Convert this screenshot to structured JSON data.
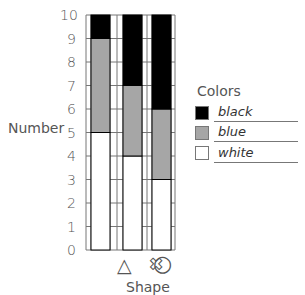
{
  "chart_data": {
    "type": "bar",
    "stacked": true,
    "title": "",
    "xlabel": "Shape",
    "ylabel": "Number",
    "ylim": [
      0,
      10
    ],
    "yticks": [
      "0",
      "1",
      "2",
      "3",
      "4",
      "5",
      "6",
      "7",
      "8",
      "9",
      "10"
    ],
    "categories": [
      "triangle",
      "cross",
      "circle"
    ],
    "category_symbols": [
      "△",
      "✖",
      "○"
    ],
    "series": [
      {
        "name": "white",
        "color": "#ffffff",
        "values": [
          5,
          4,
          3
        ]
      },
      {
        "name": "blue",
        "color": "#a6a6a6",
        "values": [
          4,
          3,
          3
        ]
      },
      {
        "name": "black",
        "color": "#000000",
        "values": [
          1,
          3,
          4
        ]
      }
    ],
    "legend": {
      "title": "Colors",
      "position": "right",
      "entries": [
        "black",
        "blue",
        "white"
      ]
    },
    "grid": true
  },
  "labels": {
    "ylabel": "Number",
    "xlabel": "Shape",
    "legend_title": "Colors",
    "legend_black": "black",
    "legend_blue": "blue",
    "legend_white": "white",
    "sym_triangle": "△",
    "sym_cross": "✖",
    "sym_circle": "○"
  }
}
